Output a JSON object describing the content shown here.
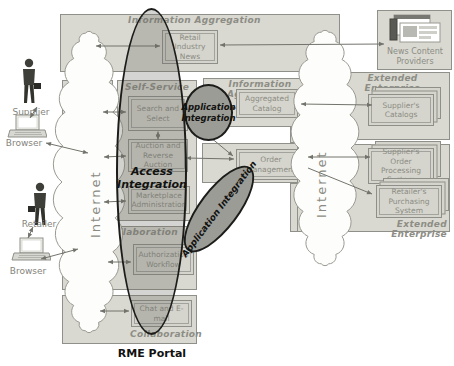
{
  "caption": "RME Portal",
  "actors": {
    "supplier": "Supplier",
    "supplier_browser": "Browser",
    "retailer": "Retailer",
    "retailer_browser": "Browser"
  },
  "clouds": {
    "left": "Internet",
    "right": "Internet"
  },
  "panels": {
    "info_agg_top": {
      "label": "Information Aggregation",
      "box": "Retail Industry News"
    },
    "news_providers": {
      "label": "News Content Providers"
    },
    "self_service": {
      "label": "Self-Service",
      "boxes": [
        "Search and Select",
        "Auction and Reverse Auction",
        "Marketplace Administration"
      ]
    },
    "collaboration": {
      "label": "Collaboration",
      "box": "Authorization Workflow"
    },
    "collaboration_bottom": {
      "label": "Collaboration",
      "box": "Chat and E-mail"
    },
    "info_agg_mid": {
      "label": "Information Aggregation",
      "box": "Aggregated Catalog"
    },
    "order": {
      "box": "Order Management"
    },
    "extended_top": {
      "label": "Extended Enterprise",
      "box": "Supplier's Catalogs"
    },
    "extended_bottom": {
      "label": "Extended Enterprise",
      "boxes": [
        "Supplier's Order Processing System",
        "Retailer's Purchasing System"
      ]
    }
  },
  "overlays": {
    "access": {
      "line1": "Access",
      "line2": "Integration"
    },
    "app_circle": {
      "line1": "Application",
      "line2": "Integration"
    },
    "app_diag": "Application Integration"
  },
  "icons": {
    "supplier": "person-icon",
    "retailer": "person-icon",
    "supplier_browser": "laptop-icon",
    "retailer_browser": "laptop-icon",
    "news_providers": "newspaper-icon",
    "clouds": "cloud-shape"
  },
  "colors": {
    "panel_fill": "#d9d9d1",
    "box_fill": "#d5d5cd",
    "panel_border": "#90908a",
    "label_gray": "#8d8d85",
    "overlay_fill": "#9c9c96",
    "overlay_outline": "#1c1c1a",
    "arrow": "#73736d",
    "caption_black": "#111111"
  }
}
